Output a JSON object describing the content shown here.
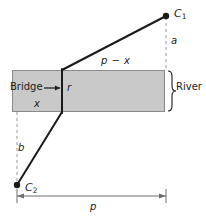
{
  "figure": {
    "colors": {
      "river_fill": "#c9c9c9",
      "river_stroke": "#8a8a8a",
      "path_stroke": "#1a1a1a",
      "dashed_stroke": "#9a9a9a",
      "dimension_stroke": "#6e6e6e",
      "text": "#1a1a1a",
      "background": "#ffffff"
    },
    "labels": {
      "point_c1": "C",
      "point_c1_sub": "1",
      "point_c2": "C",
      "point_c2_sub": "2",
      "segment_a": "a",
      "segment_b": "b",
      "segment_p_minus_x": "p − x",
      "segment_p": "p",
      "segment_x": "x",
      "bridge_width_r": "r",
      "bridge": "Bridge",
      "bridge_arrow": "⟶",
      "river": "River",
      "river_brace": "}"
    },
    "geometry": {
      "river_rect": {
        "x": 12,
        "y": 70,
        "width": 153,
        "height": 42
      },
      "bridge_line": {
        "x": 62,
        "y_top": 70,
        "y_bottom": 112
      },
      "point_c1": {
        "x": 166,
        "y": 16
      },
      "point_c2": {
        "x": 17,
        "y": 185
      },
      "dimension_p": {
        "x_start": 17,
        "x_end": 166,
        "y": 196
      },
      "dashed_a": {
        "x": 166,
        "y_start": 16,
        "y_end": 70
      },
      "dashed_b": {
        "x": 17,
        "y_start": 112,
        "y_end": 185
      }
    }
  }
}
